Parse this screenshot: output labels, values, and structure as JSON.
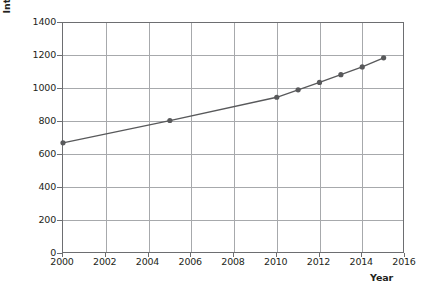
{
  "chart_data": {
    "type": "line",
    "title": "",
    "xlabel": "Year",
    "ylabel": "International tourist arrivals (millions)",
    "xlim": [
      2000,
      2016
    ],
    "ylim": [
      0,
      1400
    ],
    "grid": true,
    "legend": "none",
    "x_ticks": [
      "2000",
      "2002",
      "2004",
      "2006",
      "2008",
      "2010",
      "2012",
      "2014",
      "2016"
    ],
    "y_ticks": [
      "0",
      "200",
      "400",
      "600",
      "800",
      "1000",
      "1200",
      "1400"
    ],
    "x": [
      2000,
      2005,
      2010,
      2011,
      2012,
      2013,
      2014,
      2015
    ],
    "values": [
      674,
      809,
      950,
      995,
      1040,
      1087,
      1134,
      1189
    ],
    "series": [
      {
        "name": "International tourist arrivals",
        "marker": "circle",
        "color": "#58595b",
        "points": [
          {
            "x": 2000,
            "y": 674
          },
          {
            "x": 2005,
            "y": 809
          },
          {
            "x": 2010,
            "y": 950
          },
          {
            "x": 2011,
            "y": 995
          },
          {
            "x": 2012,
            "y": 1040
          },
          {
            "x": 2013,
            "y": 1087
          },
          {
            "x": 2014,
            "y": 1134
          },
          {
            "x": 2015,
            "y": 1189
          }
        ]
      }
    ],
    "colors": {
      "series": "#58595b",
      "gridline": "#a7a9ac",
      "axis": "#6d6e71",
      "text": "#231f20",
      "background": "#ffffff"
    }
  }
}
